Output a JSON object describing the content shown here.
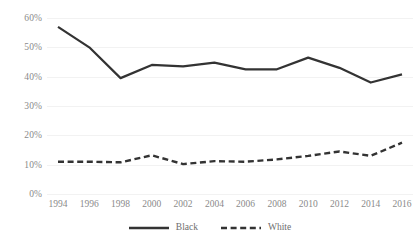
{
  "chart_data": {
    "type": "line",
    "title": "",
    "subtitle": "",
    "xlabel": "",
    "ylabel": "",
    "categories": [
      "1994",
      "1996",
      "1998",
      "2000",
      "2002",
      "2004",
      "2006",
      "2008",
      "2010",
      "2012",
      "2014",
      "2016"
    ],
    "x": [
      1994,
      1996,
      1998,
      2000,
      2002,
      2004,
      2006,
      2008,
      2010,
      2012,
      2014,
      2016
    ],
    "series": [
      {
        "name": "Black",
        "style": "solid",
        "color": "#333333",
        "values": [
          57.0,
          50.0,
          39.5,
          44.0,
          43.5,
          44.8,
          42.5,
          42.5,
          46.5,
          43.0,
          38.0,
          40.8
        ]
      },
      {
        "name": "White",
        "style": "dashed",
        "color": "#333333",
        "values": [
          11.0,
          11.0,
          10.8,
          13.2,
          10.2,
          11.2,
          11.0,
          11.8,
          13.0,
          14.5,
          13.0,
          17.5
        ]
      }
    ],
    "ylim": [
      0,
      60
    ],
    "ytick_values": [
      0,
      10,
      20,
      30,
      40,
      50,
      60
    ],
    "ytick_labels": [
      "0%",
      "10%",
      "20%",
      "30%",
      "40%",
      "50%",
      "60%"
    ],
    "xtick_labels": [
      "1994",
      "1996",
      "1998",
      "2000",
      "2002",
      "2004",
      "2006",
      "2008",
      "2010",
      "2012",
      "2014",
      "2016"
    ],
    "grid": true,
    "grid_color": "#f2f2f2",
    "legend_position": "bottom",
    "background": "#ffffff",
    "tick_label_color": "#8a8a8a"
  },
  "legend": {
    "items": [
      {
        "label": "Black",
        "style": "solid"
      },
      {
        "label": "White",
        "style": "dashed"
      }
    ]
  }
}
